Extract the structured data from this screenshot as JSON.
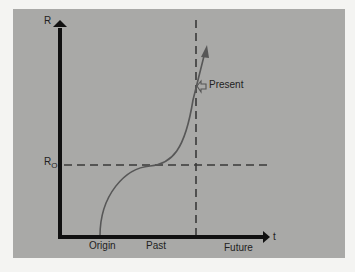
{
  "diagram": {
    "axes": {
      "y_label": "R",
      "x_label": "t"
    },
    "reference_line": {
      "label": "R",
      "subscript": "O"
    },
    "x_ticks": [
      "Origin",
      "Past",
      "Future"
    ],
    "marker": {
      "label": "Present"
    },
    "colors": {
      "panel": "#a9a9a7",
      "axis": "#111111",
      "dashed": "#3a3a3a",
      "curve": "#555555",
      "background": "#f4f4f2"
    }
  }
}
